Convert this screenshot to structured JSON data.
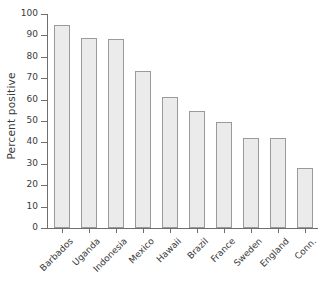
{
  "chart_data": {
    "type": "bar",
    "title": "",
    "xlabel": "",
    "ylabel": "Percent positive",
    "ylim": [
      0,
      100
    ],
    "yticks": [
      0,
      10,
      20,
      30,
      40,
      50,
      60,
      70,
      80,
      90,
      100
    ],
    "grid": false,
    "legend": "none",
    "categories": [
      "Barbados",
      "Uganda",
      "Indonesia",
      "Mexico",
      "Hawaii",
      "Brazil",
      "France",
      "Sweden",
      "England",
      "Conn."
    ],
    "values": [
      95,
      89,
      88.5,
      73.5,
      61,
      54.5,
      49.5,
      42,
      42,
      28
    ],
    "bar_fill_color": "#ebebeb",
    "bar_edge_color": "#9a9a9a",
    "axis_color": "#6e6e6e",
    "background_color": "#ffffff"
  }
}
